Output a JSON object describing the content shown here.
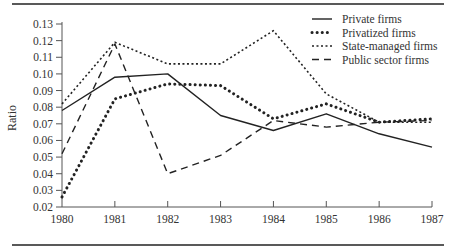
{
  "chart_data": {
    "type": "line",
    "title": "",
    "xlabel": "",
    "ylabel": "Ratio",
    "x": [
      "1980",
      "1981",
      "1982",
      "1983",
      "1984",
      "1985",
      "1986",
      "1987"
    ],
    "ylim": [
      0.02,
      0.13
    ],
    "yticks": [
      "0.02",
      "0.03",
      "0.04",
      "0.05",
      "0.06",
      "0.07",
      "0.08",
      "0.09",
      "0.10",
      "0.11",
      "0.12",
      "0.13"
    ],
    "grid": false,
    "legend_position": "upper right",
    "series": [
      {
        "name": "Private firms",
        "style": "solid",
        "values": [
          0.078,
          0.098,
          0.1,
          0.075,
          0.066,
          0.076,
          0.064,
          0.056
        ]
      },
      {
        "name": "Privatized firms",
        "style": "heavy-dotted",
        "values": [
          0.026,
          0.085,
          0.094,
          0.093,
          0.073,
          0.082,
          0.071,
          0.073
        ]
      },
      {
        "name": "State-managed firms",
        "style": "fine-dotted",
        "values": [
          0.082,
          0.119,
          0.106,
          0.106,
          0.126,
          0.088,
          0.071,
          0.071
        ]
      },
      {
        "name": "Public sector firms",
        "style": "dashed",
        "values": [
          0.052,
          0.118,
          0.04,
          0.051,
          0.072,
          0.068,
          0.071,
          0.072
        ]
      }
    ]
  },
  "legend": {
    "items": [
      {
        "label": "Private firms"
      },
      {
        "label": "Privatized firms"
      },
      {
        "label": "State-managed firms"
      },
      {
        "label": "Public sector firms"
      }
    ]
  },
  "colors": {
    "line": "#222222",
    "axis": "#555555"
  }
}
